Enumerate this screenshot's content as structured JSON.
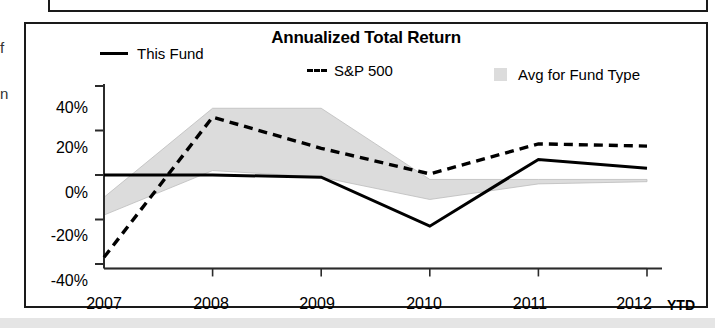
{
  "panel": {
    "title": "Annualized Total Return"
  },
  "gutter": {
    "fragment_top": "f",
    "fragment_bottom": "n"
  },
  "legend": {
    "items": [
      {
        "label": "This Fund",
        "marker": "solid-line-swatch",
        "color": "#000000"
      },
      {
        "label": "S&P 500",
        "marker": "dashed-line-swatch",
        "color": "#000000"
      },
      {
        "label": "Avg for Fund Type",
        "marker": "band-swatch",
        "color": "#dcdcdc"
      }
    ]
  },
  "axes": {
    "y_ticks": [
      "40%",
      "20%",
      "0%",
      "-20%",
      "-40%"
    ],
    "x_ticks": [
      "2007",
      "2008",
      "2009",
      "2010",
      "2011",
      "2012"
    ],
    "x_suffix": "YTD"
  },
  "chart_data": {
    "type": "line",
    "title": "Annualized Total Return",
    "xlabel": "",
    "ylabel": "",
    "categories": [
      "2007",
      "2008",
      "2009",
      "2010",
      "2011",
      "2012"
    ],
    "ylim": [
      -42,
      40
    ],
    "yticks": [
      40,
      20,
      0,
      -20,
      -40
    ],
    "grid": false,
    "legend_position": "top",
    "series": [
      {
        "name": "This Fund",
        "style": "solid",
        "color": "#000000",
        "values": [
          0,
          0,
          -1,
          -23,
          7,
          3
        ]
      },
      {
        "name": "S&P 500",
        "style": "dashed",
        "color": "#000000",
        "values": [
          -37,
          26,
          12,
          0.5,
          14,
          13
        ]
      },
      {
        "name": "Avg for Fund Type",
        "style": "band",
        "color": "#dcdcdc",
        "upper": [
          -10,
          30,
          30,
          -2,
          -2,
          -2
        ],
        "lower": [
          -18,
          2,
          -1,
          -11,
          -4,
          -3
        ]
      }
    ]
  }
}
